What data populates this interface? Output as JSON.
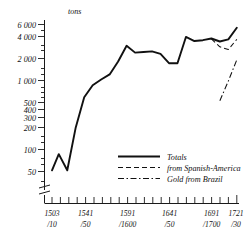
{
  "chart_data": {
    "type": "line",
    "title": "",
    "ylabel": "tons",
    "xlabel": "",
    "yscale": "log",
    "ylim": [
      40,
      6800
    ],
    "grid": false,
    "axis_break": true,
    "legend_position": "inside-lower-right",
    "ytick_labels": [
      "6 000",
      "4 000",
      "2 000",
      "1 000",
      "500",
      "400",
      "300",
      "200",
      "100",
      "50"
    ],
    "ytick_values": [
      6000,
      4000,
      2000,
      1000,
      500,
      400,
      300,
      200,
      100,
      50
    ],
    "yminor_values": [
      5000,
      3000,
      900,
      800,
      700,
      600,
      90,
      80,
      70,
      60
    ],
    "xtick_labels": [
      {
        "top": "1503",
        "bottom": "/10",
        "x": 1503
      },
      {
        "top": "1541",
        "bottom": "/50",
        "x": 1541
      },
      {
        "top": "1591",
        "bottom": "/1600",
        "x": 1591
      },
      {
        "top": "1641",
        "bottom": "/50",
        "x": 1641
      },
      {
        "top": "1691",
        "bottom": "/1700",
        "x": 1691
      },
      {
        "top": "1721",
        "bottom": "/30",
        "x": 1721
      }
    ],
    "xlim": [
      1503,
      1731
    ],
    "xtick_step": 10,
    "series": [
      {
        "name": "Totals",
        "style": "solid",
        "x": [
          1503,
          1511,
          1521,
          1531,
          1541,
          1551,
          1561,
          1571,
          1581,
          1591,
          1601,
          1611,
          1621,
          1631,
          1641,
          1651,
          1661,
          1671,
          1681,
          1691,
          1701,
          1711,
          1721
        ],
        "values": [
          52,
          88,
          52,
          210,
          560,
          830,
          1000,
          1180,
          1800,
          3000,
          2400,
          2450,
          2500,
          2300,
          1700,
          1700,
          4000,
          3500,
          3600,
          3800,
          3450,
          3700,
          5400
        ]
      },
      {
        "name": "from Spanish-America",
        "style": "dashed",
        "x": [
          1691,
          1701,
          1711,
          1721
        ],
        "values": [
          3750,
          2900,
          2650,
          3700
        ]
      },
      {
        "name": "Gold from Brazil",
        "style": "dash-dot",
        "x": [
          1701,
          1711,
          1721
        ],
        "values": [
          500,
          950,
          1900
        ]
      }
    ],
    "legend": [
      {
        "label": "Totals",
        "style": "solid"
      },
      {
        "label": "from Spanish-America",
        "style": "dashed"
      },
      {
        "label": "Gold from Brazil",
        "style": "dash-dot"
      }
    ]
  }
}
